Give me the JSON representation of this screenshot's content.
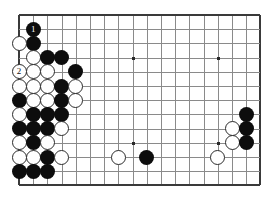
{
  "board": {
    "type": "go-board-diagram",
    "visible_columns": 18,
    "visible_rows": 13,
    "grid_spacing_px": 14.2,
    "origin_x_px": 19,
    "origin_y_px": 15,
    "line_color": "#8a8a8a",
    "edge_color": "#3a3a3a",
    "background_color": "#ffffff",
    "edges": {
      "left": true,
      "top": true,
      "right": true,
      "bottom": true
    },
    "star_points": [
      {
        "col": 8,
        "row": 3
      },
      {
        "col": 14,
        "row": 3
      },
      {
        "col": 8,
        "row": 9
      },
      {
        "col": 14,
        "row": 9
      }
    ],
    "stones": [
      {
        "col": 1,
        "row": 1,
        "color": "black",
        "label": "1"
      },
      {
        "col": 1,
        "row": 2,
        "color": "black",
        "label": ""
      },
      {
        "col": 0,
        "row": 2,
        "color": "white",
        "label": ""
      },
      {
        "col": 1,
        "row": 3,
        "color": "white",
        "label": ""
      },
      {
        "col": 2,
        "row": 3,
        "color": "black",
        "label": ""
      },
      {
        "col": 3,
        "row": 3,
        "color": "black",
        "label": ""
      },
      {
        "col": 0,
        "row": 4,
        "color": "white",
        "label": "2"
      },
      {
        "col": 1,
        "row": 4,
        "color": "white",
        "label": ""
      },
      {
        "col": 2,
        "row": 4,
        "color": "white",
        "label": ""
      },
      {
        "col": 4,
        "row": 4,
        "color": "black",
        "label": ""
      },
      {
        "col": 0,
        "row": 5,
        "color": "white",
        "label": ""
      },
      {
        "col": 1,
        "row": 5,
        "color": "white",
        "label": ""
      },
      {
        "col": 2,
        "row": 5,
        "color": "white",
        "label": ""
      },
      {
        "col": 3,
        "row": 5,
        "color": "black",
        "label": ""
      },
      {
        "col": 4,
        "row": 5,
        "color": "white",
        "label": ""
      },
      {
        "col": 0,
        "row": 6,
        "color": "black",
        "label": ""
      },
      {
        "col": 1,
        "row": 6,
        "color": "white",
        "label": ""
      },
      {
        "col": 2,
        "row": 6,
        "color": "white",
        "label": ""
      },
      {
        "col": 3,
        "row": 6,
        "color": "black",
        "label": ""
      },
      {
        "col": 4,
        "row": 6,
        "color": "white",
        "label": ""
      },
      {
        "col": 0,
        "row": 7,
        "color": "white",
        "label": ""
      },
      {
        "col": 1,
        "row": 7,
        "color": "black",
        "label": ""
      },
      {
        "col": 2,
        "row": 7,
        "color": "black",
        "label": ""
      },
      {
        "col": 3,
        "row": 7,
        "color": "black",
        "label": ""
      },
      {
        "col": 0,
        "row": 8,
        "color": "black",
        "label": ""
      },
      {
        "col": 1,
        "row": 8,
        "color": "black",
        "label": ""
      },
      {
        "col": 2,
        "row": 8,
        "color": "black",
        "label": ""
      },
      {
        "col": 3,
        "row": 8,
        "color": "white",
        "label": ""
      },
      {
        "col": 0,
        "row": 9,
        "color": "white",
        "label": ""
      },
      {
        "col": 1,
        "row": 9,
        "color": "black",
        "label": ""
      },
      {
        "col": 2,
        "row": 9,
        "color": "white",
        "label": ""
      },
      {
        "col": 0,
        "row": 10,
        "color": "white",
        "label": ""
      },
      {
        "col": 1,
        "row": 10,
        "color": "white",
        "label": ""
      },
      {
        "col": 2,
        "row": 10,
        "color": "black",
        "label": ""
      },
      {
        "col": 3,
        "row": 10,
        "color": "white",
        "label": ""
      },
      {
        "col": 0,
        "row": 11,
        "color": "black",
        "label": ""
      },
      {
        "col": 1,
        "row": 11,
        "color": "black",
        "label": ""
      },
      {
        "col": 2,
        "row": 11,
        "color": "black",
        "label": ""
      },
      {
        "col": 7,
        "row": 10,
        "color": "white",
        "label": ""
      },
      {
        "col": 9,
        "row": 10,
        "color": "black",
        "label": ""
      },
      {
        "col": 14,
        "row": 10,
        "color": "white",
        "label": ""
      },
      {
        "col": 16,
        "row": 7,
        "color": "black",
        "label": ""
      },
      {
        "col": 15,
        "row": 8,
        "color": "white",
        "label": ""
      },
      {
        "col": 16,
        "row": 8,
        "color": "black",
        "label": ""
      },
      {
        "col": 15,
        "row": 9,
        "color": "white",
        "label": ""
      },
      {
        "col": 16,
        "row": 9,
        "color": "black",
        "label": ""
      }
    ]
  }
}
